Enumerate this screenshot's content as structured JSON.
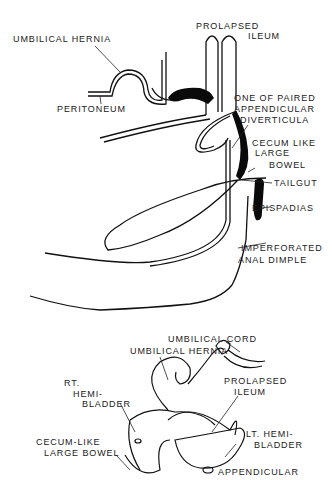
{
  "top_figure": {
    "labels": {
      "prolapsed_ileum_1": "PROLAPSED",
      "prolapsed_ileum_2": "ILEUM",
      "umbilical_hernia": "UMBILICAL HERNIA",
      "peritoneum": "PERITONEUM",
      "appendicular_1": "ONE OF PAIRED",
      "appendicular_2": "APPENDICULAR",
      "appendicular_3": "DIVERTICULA",
      "cecum_1": "CECUM LIKE",
      "cecum_2": "LARGE",
      "cecum_3": "BOWEL",
      "tailgut": "TAILGUT",
      "epispadias": "EPISPADIAS",
      "anal_1": "IMPERFORATED",
      "anal_2": "ANAL DIMPLE"
    }
  },
  "bottom_figure": {
    "labels": {
      "umbilical_cord": "UMBILICAL CORD",
      "umbilical_hernia": "UMBILICAL HERNIA",
      "rt_bladder_1": "RT.",
      "rt_bladder_2": "HEMI-",
      "rt_bladder_3": "BLADDER",
      "prolapsed_1": "PROLAPSED",
      "prolapsed_2": "ILEUM",
      "lt_bladder_1": "LT. HEMI-",
      "lt_bladder_2": "BLADDER",
      "cecum_1": "CECUM-LIKE",
      "cecum_2": "LARGE BOWEL",
      "appendicular": "APPENDICULAR"
    }
  }
}
